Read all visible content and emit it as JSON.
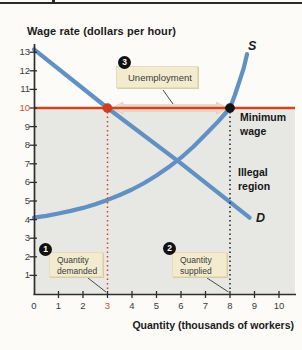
{
  "title": "Wage rate (dollars per hour)",
  "x_axis_title": "Quantity (thousands of workers)",
  "chart_data": {
    "type": "line",
    "title": "Wage rate (dollars per hour)",
    "xlabel": "Quantity (thousands of workers)",
    "ylabel": "Wage rate (dollars per hour)",
    "xlim": [
      0,
      10
    ],
    "ylim": [
      0,
      13
    ],
    "x_ticks": [
      0,
      1,
      2,
      3,
      4,
      5,
      6,
      7,
      8,
      9,
      10
    ],
    "y_ticks": [
      1,
      2,
      3,
      4,
      5,
      6,
      7,
      8,
      9,
      10,
      11,
      12,
      13
    ],
    "highlight_x_tick": 3,
    "highlight_y_tick": 10,
    "grid": false,
    "legend_position": "none",
    "minimum_wage": 10,
    "quantity_demanded": 3,
    "quantity_supplied": 8,
    "unemployment": 5,
    "equilibrium": [
      5.85,
      7.15
    ],
    "series": [
      {
        "name": "Supply",
        "label": "S",
        "points": [
          [
            0,
            4.1
          ],
          [
            0.5,
            4.2
          ],
          [
            1,
            4.33
          ],
          [
            1.5,
            4.47
          ],
          [
            2,
            4.63
          ],
          [
            2.5,
            4.83
          ],
          [
            3,
            5.06
          ],
          [
            3.5,
            5.32
          ],
          [
            4,
            5.62
          ],
          [
            4.5,
            5.97
          ],
          [
            5,
            6.37
          ],
          [
            5.5,
            6.82
          ],
          [
            6,
            7.33
          ],
          [
            6.5,
            7.92
          ],
          [
            7,
            8.58
          ],
          [
            7.5,
            9.25
          ],
          [
            8,
            10.0
          ],
          [
            8.2,
            10.7
          ],
          [
            8.4,
            11.5
          ],
          [
            8.55,
            12.1
          ],
          [
            8.7,
            12.9
          ]
        ]
      },
      {
        "name": "Demand",
        "label": "D",
        "points": [
          [
            0,
            13.15
          ],
          [
            3,
            10
          ],
          [
            6,
            7.02
          ],
          [
            8.8,
            4.1
          ]
        ]
      }
    ],
    "marked_points": [
      {
        "name": "quantity-demanded-point",
        "x": 3,
        "y": 10,
        "color": "#cf3d1c"
      },
      {
        "name": "quantity-supplied-point",
        "x": 8,
        "y": 10,
        "color": "#141414"
      }
    ]
  },
  "annotations": {
    "badge_demanded": "1",
    "badge_supplied": "2",
    "badge_unemployment": "3",
    "unemployment_label": "Unemployment",
    "quantity_demanded_line1": "Quantity",
    "quantity_demanded_line2": "demanded",
    "quantity_supplied_line1": "Quantity",
    "quantity_supplied_line2": "supplied",
    "minimum_wage_line1": "Minimum",
    "minimum_wage_line2": "wage",
    "illegal_region_line1": "Illegal",
    "illegal_region_line2": "region",
    "supply_label": "S",
    "demand_label": "D"
  },
  "colors": {
    "curve": "#6190c2",
    "min_wage_line": "#cf4425",
    "red_dot": "#cf3d1c",
    "black_dot": "#141414",
    "gray_region": "#e7e8e3",
    "arrow_fill": "#eedbc9",
    "arrow_edge": "#e3c6ad",
    "axis": "#2e2e2e",
    "tick_label": "#3a3a3a",
    "highlight_tick": "#c8502b",
    "leader_line": "#4a4a4a"
  }
}
